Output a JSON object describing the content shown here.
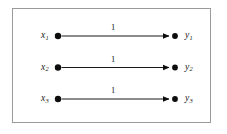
{
  "figure": {
    "type": "bipartite-graph-diagram",
    "background_color": "#ffffff",
    "frame": {
      "border_color": "#9a9a9a",
      "border_width_px": 1,
      "x": 12,
      "y": 8,
      "width": 199,
      "height": 115
    },
    "ink_color": "#0d0d0d"
  },
  "graph": {
    "source_nodes": [
      {
        "id": "x1",
        "label": "x",
        "subscript": "1",
        "x": 58,
        "y": 36
      },
      {
        "id": "x2",
        "label": "x",
        "subscript": "2",
        "x": 58,
        "y": 68
      },
      {
        "id": "x3",
        "label": "x",
        "subscript": "3",
        "x": 58,
        "y": 99
      }
    ],
    "target_nodes": [
      {
        "id": "y1",
        "label": "y",
        "subscript": "1",
        "x": 175,
        "y": 36
      },
      {
        "id": "y2",
        "label": "y",
        "subscript": "2",
        "x": 175,
        "y": 68
      },
      {
        "id": "y3",
        "label": "y",
        "subscript": "3",
        "x": 175,
        "y": 99
      }
    ],
    "edges": [
      {
        "from": "x1",
        "to": "y1",
        "weight": "1",
        "directed": true
      },
      {
        "from": "x2",
        "to": "y2",
        "weight": "1",
        "directed": true
      },
      {
        "from": "x3",
        "to": "y3",
        "weight": "1",
        "directed": true
      }
    ]
  },
  "labels": {
    "x1": "x",
    "x1_sub": "1",
    "x2": "x",
    "x2_sub": "2",
    "x3": "x",
    "x3_sub": "3",
    "y1": "y",
    "y1_sub": "1",
    "y2": "y",
    "y2_sub": "2",
    "y3": "y",
    "y3_sub": "3",
    "w1": "1",
    "w2": "1",
    "w3": "1"
  }
}
